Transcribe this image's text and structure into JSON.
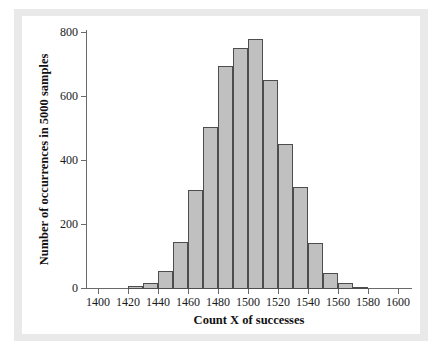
{
  "chart_data": {
    "type": "bar",
    "title": "",
    "subtitle": "",
    "xlabel": "Count X of successes",
    "ylabel": "Number of occurrences in 5000 samples",
    "xlim": [
      1400,
      1600
    ],
    "ylim": [
      0,
      800
    ],
    "xticks": [
      1400,
      1420,
      1440,
      1460,
      1480,
      1500,
      1520,
      1540,
      1560,
      1580,
      1600
    ],
    "yticks": [
      0,
      200,
      400,
      600,
      800
    ],
    "grid": false,
    "legend": null,
    "bin_width": 10,
    "bin_starts": [
      1420,
      1430,
      1440,
      1450,
      1460,
      1470,
      1480,
      1490,
      1500,
      1510,
      1520,
      1530,
      1540,
      1550,
      1560,
      1570
    ],
    "categories": [
      "1420-1430",
      "1430-1440",
      "1440-1450",
      "1450-1460",
      "1460-1470",
      "1470-1480",
      "1480-1490",
      "1490-1500",
      "1500-1510",
      "1510-1520",
      "1520-1530",
      "1530-1540",
      "1540-1550",
      "1550-1560",
      "1560-1570",
      "1570-1580"
    ],
    "values": [
      8,
      18,
      57,
      148,
      310,
      505,
      697,
      753,
      780,
      653,
      452,
      320,
      145,
      50,
      18,
      5
    ],
    "bar_color": "#c0c0c0",
    "bar_edge_color": "#4d4d4d",
    "axis_color": "#6a6a6a",
    "panel_background": "#ffffff",
    "plate_background": "#e9e9e9"
  },
  "axes": {
    "x_tick_labels": [
      "1400",
      "1420",
      "1440",
      "1460",
      "1480",
      "1500",
      "1520",
      "1540",
      "1560",
      "1580",
      "1600"
    ],
    "y_tick_labels": [
      "0",
      "200",
      "400",
      "600",
      "800"
    ],
    "x_title": "Count X of successes",
    "y_title": "Number of occurrences in 5000 samples"
  }
}
